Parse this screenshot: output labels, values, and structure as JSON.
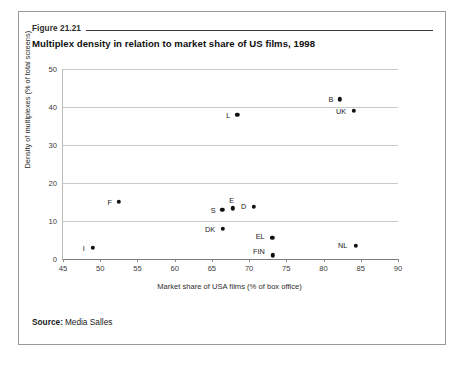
{
  "figure": {
    "number": "Figure 21.21",
    "title": "Multiplex density in relation to market share of US films, 1998",
    "source_label": "Source:",
    "source_value": "Media Salles"
  },
  "chart_data": {
    "type": "scatter",
    "title": "Multiplex density in relation to market share of US films, 1998",
    "xlabel": "Market share of USA films (% of box office)",
    "ylabel": "Density of multiplexes (% of total screens)",
    "xlim": [
      45,
      90
    ],
    "ylim": [
      0,
      50
    ],
    "xticks": [
      45,
      50,
      55,
      60,
      65,
      70,
      75,
      80,
      85,
      90
    ],
    "yticks": [
      0,
      10,
      20,
      30,
      40,
      50
    ],
    "grid": "horizontal",
    "legend": "none",
    "marker_color": "#111111",
    "points": [
      {
        "label": "I",
        "x": 49.0,
        "y": 3.0,
        "label_dx": -9,
        "label_dy": 0
      },
      {
        "label": "F",
        "x": 52.5,
        "y": 15.0,
        "label_dx": -9,
        "label_dy": 0
      },
      {
        "label": "S",
        "x": 66.4,
        "y": 13.0,
        "label_dx": -9,
        "label_dy": 0
      },
      {
        "label": "DK",
        "x": 66.5,
        "y": 8.0,
        "label_dx": -13,
        "label_dy": 0
      },
      {
        "label": "E",
        "x": 67.8,
        "y": 13.3,
        "label_dx": -1,
        "label_dy": -8
      },
      {
        "label": "L",
        "x": 68.4,
        "y": 38.0,
        "label_dx": -9,
        "label_dy": 0
      },
      {
        "label": "D",
        "x": 70.6,
        "y": 13.8,
        "label_dx": -10,
        "label_dy": -1
      },
      {
        "label": "EL",
        "x": 73.1,
        "y": 5.5,
        "label_dx": -12,
        "label_dy": -2
      },
      {
        "label": "FIN",
        "x": 73.2,
        "y": 1.0,
        "label_dx": -14,
        "label_dy": -4
      },
      {
        "label": "B",
        "x": 82.2,
        "y": 42.0,
        "label_dx": -9,
        "label_dy": 0
      },
      {
        "label": "UK",
        "x": 84.1,
        "y": 39.0,
        "label_dx": -13,
        "label_dy": 0
      },
      {
        "label": "NL",
        "x": 84.3,
        "y": 3.5,
        "label_dx": -13,
        "label_dy": -1
      }
    ]
  }
}
